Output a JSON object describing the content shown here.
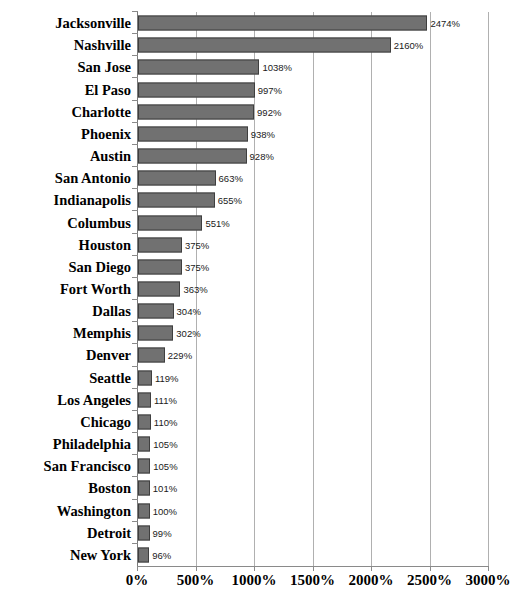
{
  "chart_data": {
    "type": "bar",
    "orientation": "horizontal",
    "title": "",
    "xlabel": "",
    "ylabel": "",
    "xlim": [
      0,
      3000
    ],
    "grid": true,
    "legend": false,
    "value_suffix": "%",
    "bar_color": "#717171",
    "bar_border_color": "#3f3f3f",
    "gridline_color": "#b0b0b0",
    "axis_color": "#8a8a8a",
    "xticks": [
      0,
      500,
      1000,
      1500,
      2000,
      2500,
      3000
    ],
    "xtick_labels": [
      "0%",
      "500%",
      "1000%",
      "1500%",
      "2000%",
      "2500%",
      "3000%"
    ],
    "categories": [
      "Jacksonville",
      "Nashville",
      "San Jose",
      "El Paso",
      "Charlotte",
      "Phoenix",
      "Austin",
      "San Antonio",
      "Indianapolis",
      "Columbus",
      "Houston",
      "San Diego",
      "Fort Worth",
      "Dallas",
      "Memphis",
      "Denver",
      "Seattle",
      "Los Angeles",
      "Chicago",
      "Philadelphia",
      "San Francisco",
      "Boston",
      "Washington",
      "Detroit",
      "New York"
    ],
    "values": [
      2474,
      2160,
      1038,
      997,
      992,
      938,
      928,
      663,
      655,
      551,
      375,
      375,
      363,
      304,
      302,
      229,
      119,
      111,
      110,
      105,
      105,
      101,
      100,
      99,
      96
    ],
    "data_labels": [
      "2474%",
      "2160%",
      "1038%",
      "997%",
      "992%",
      "938%",
      "928%",
      "663%",
      "655%",
      "551%",
      "375%",
      "375%",
      "363%",
      "304%",
      "302%",
      "229%",
      "119%",
      "111%",
      "110%",
      "105%",
      "105%",
      "101%",
      "100%",
      "99%",
      "96%"
    ]
  },
  "caption": {
    "text": ""
  }
}
